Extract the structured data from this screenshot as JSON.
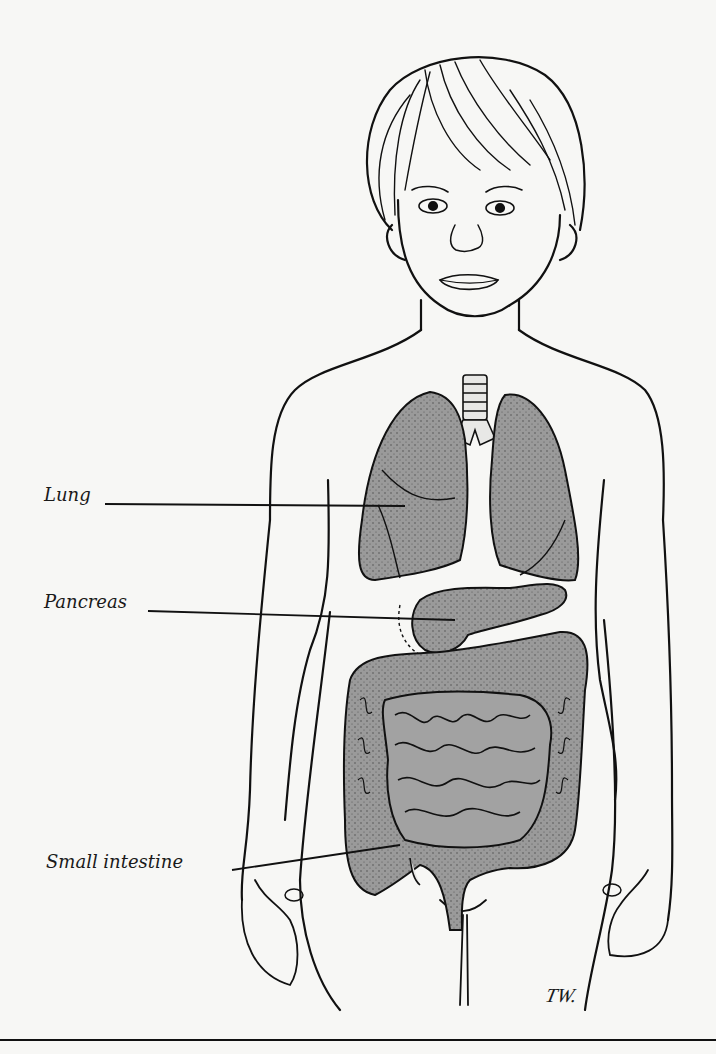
{
  "figure": {
    "colors": {
      "background": "#f7f7f5",
      "line": "#111111",
      "organ_fill": "#9a9a9a",
      "organ_shadow": "#555555"
    }
  },
  "labels": [
    {
      "text": "Lung",
      "x": 44,
      "y": 496,
      "line": [
        105,
        504,
        405,
        506
      ]
    },
    {
      "text": "Pancreas",
      "x": 44,
      "y": 603,
      "line": [
        148,
        611,
        455,
        620
      ]
    },
    {
      "text": "Small intestine",
      "x": 46,
      "y": 863,
      "line": [
        232,
        870,
        400,
        845
      ]
    }
  ],
  "signature": {
    "text": "TW.",
    "x": 546,
    "y": 1000
  },
  "bottom_rule_y": 1040
}
